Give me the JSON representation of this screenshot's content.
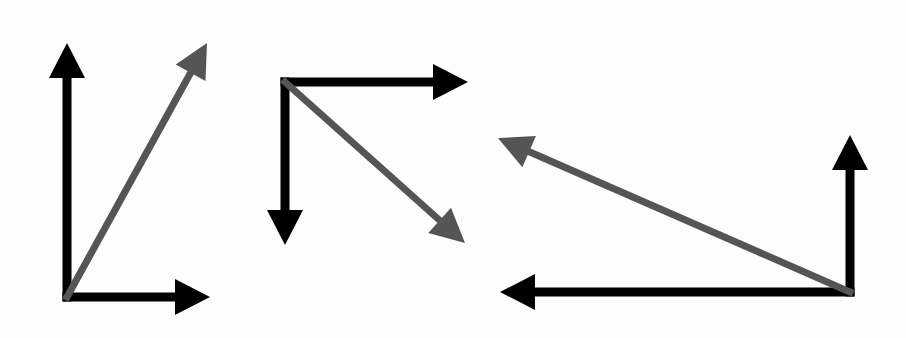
{
  "diagram": {
    "colors": {
      "component": "#000000",
      "resultant": "#555555",
      "background": "#fdfdfd"
    },
    "groups": [
      {
        "name": "group-1",
        "origin": [
          67,
          297
        ],
        "components": [
          {
            "direction": "up",
            "tip": [
              67,
              43
            ]
          },
          {
            "direction": "right",
            "tip": [
              210,
              297
            ]
          }
        ],
        "resultant": {
          "direction": "up-right",
          "tip": [
            207,
            43
          ]
        }
      },
      {
        "name": "group-2",
        "origin": [
          285,
          82
        ],
        "components": [
          {
            "direction": "right",
            "tip": [
              468,
              82
            ]
          },
          {
            "direction": "down",
            "tip": [
              285,
              245
            ]
          }
        ],
        "resultant": {
          "direction": "down-right",
          "tip": [
            465,
            243
          ]
        }
      },
      {
        "name": "group-3",
        "origin": [
          850,
          292
        ],
        "components": [
          {
            "direction": "up",
            "tip": [
              850,
              135
            ]
          },
          {
            "direction": "left",
            "tip": [
              500,
              292
            ]
          }
        ],
        "resultant": {
          "direction": "up-left",
          "tip": [
            498,
            138
          ]
        }
      }
    ]
  }
}
